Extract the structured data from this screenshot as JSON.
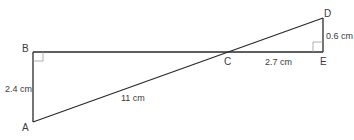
{
  "diagram": {
    "type": "geometry",
    "points": {
      "A": {
        "label": "A"
      },
      "B": {
        "label": "B"
      },
      "C": {
        "label": "C"
      },
      "D": {
        "label": "D"
      },
      "E": {
        "label": "E"
      }
    },
    "measurements": {
      "AB": "2.4 cm",
      "AD": "11 cm",
      "CE": "2.7 cm",
      "DE": "0.6 cm"
    },
    "right_angles": [
      "B",
      "E"
    ],
    "colors": {
      "line": "#2a2a2a",
      "right_angle_marker": "#999999",
      "text": "#3a3a3a"
    }
  }
}
